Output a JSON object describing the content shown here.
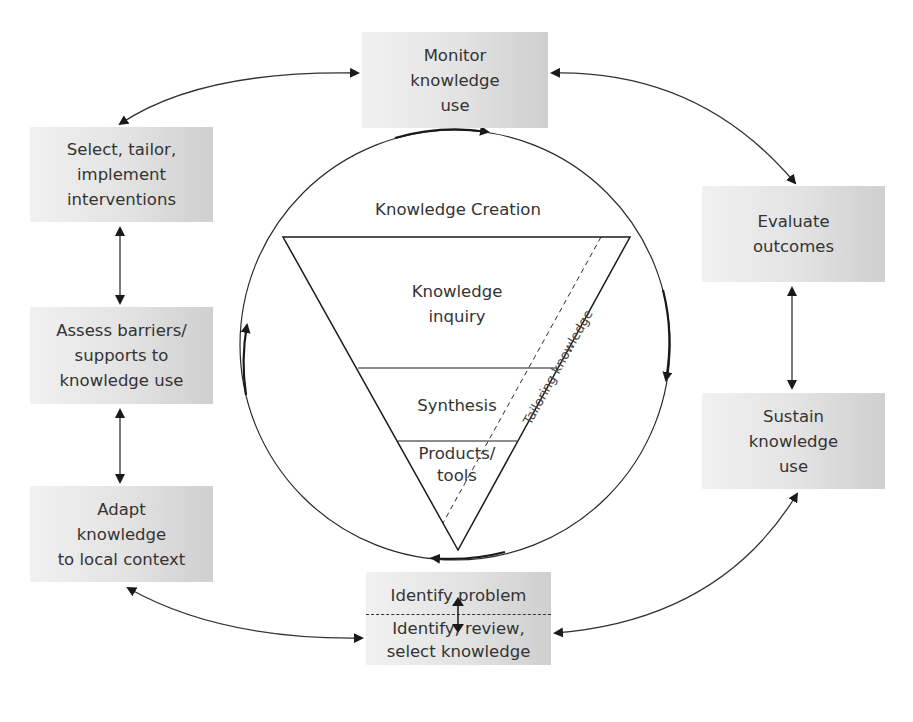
{
  "diagram": {
    "center": {
      "outer_label": "Knowledge Creation",
      "funnel": [
        {
          "id": "inquiry",
          "lines": [
            "Knowledge",
            "inquiry"
          ]
        },
        {
          "id": "synthesis",
          "lines": [
            "Synthesis"
          ]
        },
        {
          "id": "products",
          "lines": [
            "Products/",
            "tools"
          ]
        }
      ],
      "dashed_label": "Tailoring knowledge"
    },
    "action_cycle": [
      {
        "id": "identify",
        "lines": [
          "Identify problem"
        ],
        "lines_lower": [
          "Identify, review,",
          "select knowledge"
        ]
      },
      {
        "id": "adapt",
        "lines": [
          "Adapt",
          "knowledge",
          "to local context"
        ]
      },
      {
        "id": "assess",
        "lines": [
          "Assess barriers/",
          "supports to",
          "knowledge use"
        ]
      },
      {
        "id": "select",
        "lines": [
          "Select, tailor,",
          "implement",
          "interventions"
        ]
      },
      {
        "id": "monitor",
        "lines": [
          "Monitor",
          "knowledge",
          "use"
        ]
      },
      {
        "id": "evaluate",
        "lines": [
          "Evaluate",
          "outcomes"
        ]
      },
      {
        "id": "sustain",
        "lines": [
          "Sustain",
          "knowledge",
          "use"
        ]
      }
    ],
    "colors": {
      "box_light": "#f1f1f1",
      "box_dark": "#cfcfcf",
      "line": "#2a2a2a",
      "text": "#333333"
    }
  }
}
